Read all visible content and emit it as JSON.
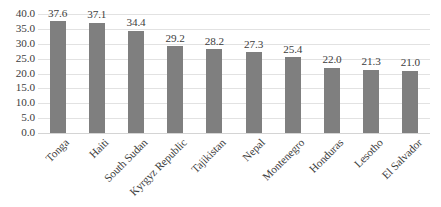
{
  "chart_data": {
    "type": "bar",
    "title": "",
    "subtitle": "",
    "xlabel": "",
    "ylabel": "",
    "categories": [
      "Tonga",
      "Haiti",
      "South Sudan",
      "Kyrgyz Republic",
      "Tajikistan",
      "Nepal",
      "Montenegro",
      "Honduras",
      "Lesotho",
      "El Salvador"
    ],
    "values": [
      37.6,
      37.1,
      34.4,
      29.2,
      28.2,
      27.3,
      25.4,
      22.0,
      21.3,
      21.0
    ],
    "value_labels": [
      "37.6",
      "37.1",
      "34.4",
      "29.2",
      "28.2",
      "27.3",
      "25.4",
      "22.0",
      "21.3",
      "21.0"
    ],
    "ylim": [
      0.0,
      40.0
    ],
    "ytick_labels": [
      "40.0",
      "35.0",
      "30.0",
      "25.0",
      "20.0",
      "15.0",
      "10.0",
      "5.0",
      "0.0"
    ],
    "ytick_values": [
      40.0,
      35.0,
      30.0,
      25.0,
      20.0,
      15.0,
      10.0,
      5.0,
      0.0
    ],
    "grid": true,
    "legend": "none",
    "legend_position": "none",
    "bar_color": "#7f7f7f",
    "gridline_color": "#e2e2e2",
    "text_color": "#3d3d3d",
    "background_color": "#ffffff",
    "xtick_label_rotation": -45,
    "data_labels_shown": true
  }
}
